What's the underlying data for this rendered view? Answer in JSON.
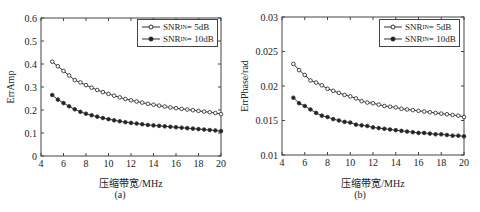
{
  "chart_data": [
    {
      "type": "line",
      "panel": "(a)",
      "xlabel": "压缩带宽/MHz",
      "ylabel": "ErrAmp",
      "xlim": [
        4,
        20
      ],
      "ylim": [
        0,
        0.6
      ],
      "xticks": [
        4,
        6,
        8,
        10,
        12,
        14,
        16,
        18,
        20
      ],
      "yticks": [
        0,
        0.1,
        0.2,
        0.3,
        0.4,
        0.5,
        0.6
      ],
      "ytick_labels": [
        "0",
        "0.1",
        "0.2",
        "0.3",
        "0.4",
        "0.5",
        "0.6"
      ],
      "legend_position": "upper right",
      "x": [
        5,
        5.5,
        6,
        6.5,
        7,
        7.5,
        8,
        8.5,
        9,
        9.5,
        10,
        10.5,
        11,
        11.5,
        12,
        12.5,
        13,
        13.5,
        14,
        14.5,
        15,
        15.5,
        16,
        16.5,
        17,
        17.5,
        18,
        18.5,
        19,
        19.5,
        20
      ],
      "series": [
        {
          "name": "SNR_IN = 5dB",
          "marker": "open-circle",
          "values": [
            0.41,
            0.39,
            0.37,
            0.35,
            0.33,
            0.32,
            0.308,
            0.297,
            0.287,
            0.278,
            0.27,
            0.262,
            0.255,
            0.248,
            0.242,
            0.237,
            0.232,
            0.227,
            0.223,
            0.219,
            0.215,
            0.211,
            0.208,
            0.205,
            0.202,
            0.199,
            0.196,
            0.193,
            0.19,
            0.187,
            0.182
          ]
        },
        {
          "name": "SNR_IN = 10dB",
          "marker": "filled-circle",
          "values": [
            0.265,
            0.245,
            0.23,
            0.216,
            0.203,
            0.192,
            0.184,
            0.177,
            0.171,
            0.165,
            0.16,
            0.155,
            0.151,
            0.147,
            0.144,
            0.141,
            0.138,
            0.135,
            0.133,
            0.131,
            0.129,
            0.127,
            0.125,
            0.123,
            0.121,
            0.119,
            0.117,
            0.115,
            0.113,
            0.111,
            0.108
          ]
        }
      ]
    },
    {
      "type": "line",
      "panel": "(b)",
      "xlabel": "压缩带宽/MHz",
      "ylabel": "ErrPhase/rad",
      "xlim": [
        4,
        20
      ],
      "ylim": [
        0.01,
        0.03
      ],
      "xticks": [
        4,
        6,
        8,
        10,
        12,
        14,
        16,
        18,
        20
      ],
      "yticks": [
        0.01,
        0.015,
        0.02,
        0.025,
        0.03
      ],
      "ytick_labels": [
        "0.01",
        "0.015",
        "0.02",
        "0.025",
        "0.03"
      ],
      "legend_position": "upper right",
      "x": [
        5,
        5.5,
        6,
        6.5,
        7,
        7.5,
        8,
        8.5,
        9,
        9.5,
        10,
        10.5,
        11,
        11.5,
        12,
        12.5,
        13,
        13.5,
        14,
        14.5,
        15,
        15.5,
        16,
        16.5,
        17,
        17.5,
        18,
        18.5,
        19,
        19.5,
        20
      ],
      "series": [
        {
          "name": "SNR_IN = 5dB",
          "marker": "open-circle",
          "values": [
            0.0232,
            0.0223,
            0.0216,
            0.0208,
            0.0205,
            0.0201,
            0.0196,
            0.0193,
            0.019,
            0.0187,
            0.0185,
            0.0182,
            0.0178,
            0.0176,
            0.0175,
            0.0173,
            0.0171,
            0.017,
            0.0169,
            0.0167,
            0.0166,
            0.0165,
            0.0164,
            0.0163,
            0.0162,
            0.0161,
            0.016,
            0.0159,
            0.0158,
            0.0157,
            0.0155
          ]
        },
        {
          "name": "SNR_IN = 10dB",
          "marker": "filled-circle",
          "values": [
            0.0183,
            0.0175,
            0.0171,
            0.0166,
            0.0161,
            0.0157,
            0.0155,
            0.0152,
            0.015,
            0.0148,
            0.0147,
            0.0144,
            0.0143,
            0.0142,
            0.014,
            0.0139,
            0.0138,
            0.0137,
            0.0136,
            0.0135,
            0.0134,
            0.0133,
            0.0132,
            0.0132,
            0.0131,
            0.013,
            0.013,
            0.0129,
            0.0128,
            0.0128,
            0.0127
          ]
        }
      ]
    }
  ],
  "panels": [
    {
      "caption": "(a)",
      "ylabel": "ErrAmp",
      "xlabel": "压缩带宽/MHz",
      "legend": [
        {
          "prefix": "SNR",
          "sub": "IN",
          "suffix": " = 5dB"
        },
        {
          "prefix": "SNR",
          "sub": "IN",
          "suffix": " = 10dB"
        }
      ]
    },
    {
      "caption": "(b)",
      "ylabel": "ErrPhase/rad",
      "xlabel": "压缩带宽/MHz",
      "legend": [
        {
          "prefix": "SNR",
          "sub": "IN",
          "suffix": " = 5dB"
        },
        {
          "prefix": "SNR",
          "sub": "IN",
          "suffix": " = 10dB"
        }
      ]
    }
  ]
}
